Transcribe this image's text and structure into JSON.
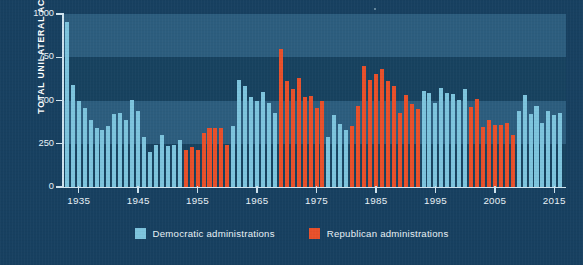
{
  "chart": {
    "ylabel": "TOTAL UNILATERAL ACTIONS",
    "yticks": [
      "1000",
      "750",
      "500",
      "250",
      "0"
    ],
    "xticks": [
      "1935",
      "1945",
      "1955",
      "1965",
      "1975",
      "1985",
      "1995",
      "2005",
      "2015"
    ]
  },
  "legend": {
    "democratic": "Democratic administrations",
    "republican": "Republican administrations"
  },
  "colors": {
    "background": "#174060",
    "band_light": "#3a6f92",
    "band_dark": "#17425f",
    "democratic": "#7dc4dd",
    "republican": "#e8502a",
    "axis": "#cfe3ef",
    "text": "#e9f2f7"
  },
  "chart_data": {
    "type": "bar",
    "title": "",
    "xlabel": "",
    "ylabel": "TOTAL UNILATERAL ACTIONS",
    "ylim": [
      0,
      1000
    ],
    "xlim": [
      1933,
      2016
    ],
    "yticks": [
      0,
      250,
      500,
      750,
      1000
    ],
    "xticks": [
      1935,
      1945,
      1955,
      1965,
      1975,
      1985,
      1995,
      2005,
      2015
    ],
    "grid": "horizontal-bands",
    "legend_position": "bottom-center",
    "series": [
      {
        "name": "Democratic administrations",
        "color": "#7dc4dd"
      },
      {
        "name": "Republican administrations",
        "color": "#e8502a"
      }
    ],
    "x": [
      1933,
      1934,
      1935,
      1936,
      1937,
      1938,
      1939,
      1940,
      1941,
      1942,
      1943,
      1944,
      1945,
      1946,
      1947,
      1948,
      1949,
      1950,
      1951,
      1952,
      1953,
      1954,
      1955,
      1956,
      1957,
      1958,
      1959,
      1960,
      1961,
      1962,
      1963,
      1964,
      1965,
      1966,
      1967,
      1968,
      1969,
      1970,
      1971,
      1972,
      1973,
      1974,
      1975,
      1976,
      1977,
      1978,
      1979,
      1980,
      1981,
      1982,
      1983,
      1984,
      1985,
      1986,
      1987,
      1988,
      1989,
      1990,
      1991,
      1992,
      1993,
      1994,
      1995,
      1996,
      1997,
      1998,
      1999,
      2000,
      2001,
      2002,
      2003,
      2004,
      2005,
      2006,
      2007,
      2008,
      2009,
      2010,
      2011,
      2012,
      2013,
      2014,
      2015,
      2016
    ],
    "values": [
      955,
      590,
      495,
      455,
      390,
      340,
      330,
      355,
      420,
      425,
      390,
      505,
      440,
      290,
      205,
      240,
      300,
      235,
      240,
      270,
      215,
      230,
      215,
      310,
      340,
      340,
      340,
      245,
      350,
      620,
      585,
      520,
      500,
      550,
      485,
      430,
      795,
      610,
      565,
      630,
      520,
      525,
      455,
      500,
      290,
      415,
      365,
      330,
      355,
      470,
      700,
      620,
      655,
      680,
      615,
      585,
      430,
      530,
      480,
      450,
      555,
      545,
      485,
      575,
      545,
      540,
      505,
      565,
      460,
      510,
      345,
      385,
      360,
      360,
      370,
      300,
      440,
      530,
      420,
      470,
      370,
      440,
      415,
      430
    ],
    "party": [
      "D",
      "D",
      "D",
      "D",
      "D",
      "D",
      "D",
      "D",
      "D",
      "D",
      "D",
      "D",
      "D",
      "D",
      "D",
      "D",
      "D",
      "D",
      "D",
      "D",
      "R",
      "R",
      "R",
      "R",
      "R",
      "R",
      "R",
      "R",
      "D",
      "D",
      "D",
      "D",
      "D",
      "D",
      "D",
      "D",
      "R",
      "R",
      "R",
      "R",
      "R",
      "R",
      "R",
      "R",
      "D",
      "D",
      "D",
      "D",
      "R",
      "R",
      "R",
      "R",
      "R",
      "R",
      "R",
      "R",
      "R",
      "R",
      "R",
      "R",
      "D",
      "D",
      "D",
      "D",
      "D",
      "D",
      "D",
      "D",
      "R",
      "R",
      "R",
      "R",
      "R",
      "R",
      "R",
      "R",
      "D",
      "D",
      "D",
      "D",
      "D",
      "D",
      "D",
      "D"
    ]
  }
}
